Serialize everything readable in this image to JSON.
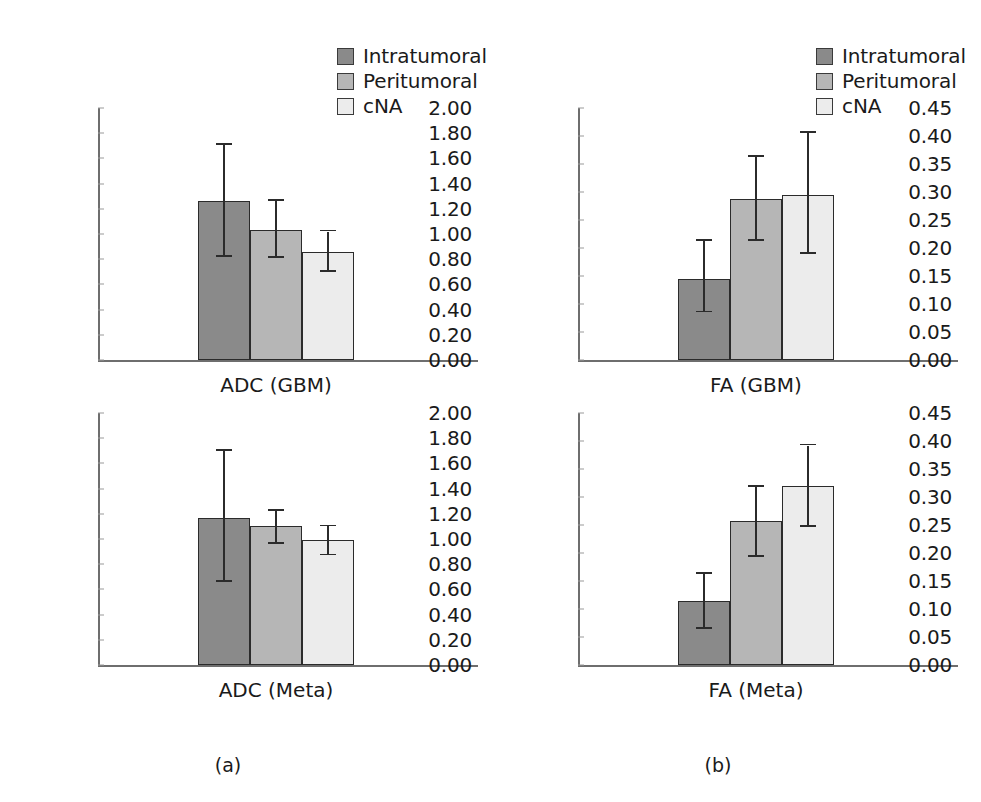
{
  "figure": {
    "captions": [
      {
        "text": "(a)",
        "x": 228,
        "y": 755
      },
      {
        "text": "(b)",
        "x": 718,
        "y": 755
      }
    ]
  },
  "legend": {
    "items": [
      {
        "label": "Intratumoral",
        "color": "#8a8a8a",
        "swatch_name": "legend-swatch-intratumoral"
      },
      {
        "label": "Peritumoral",
        "color": "#b6b6b6",
        "swatch_name": "legend-swatch-peritumoral"
      },
      {
        "label": "cNA",
        "color": "#ececec",
        "swatch_name": "legend-swatch-cna"
      }
    ]
  },
  "colors": {
    "intratumoral": "#8a8a8a",
    "peritumoral": "#b6b6b6",
    "cna": "#ececec",
    "bar_outline": "#2b2b2b",
    "axis": "#6e6e6e",
    "text": "#1a1a1a"
  },
  "chart_data": [
    {
      "id": "adc-gbm",
      "type": "bar",
      "title": "",
      "xlabel": "ADC (GBM)",
      "ylabel": "",
      "ylim": [
        0,
        2.0
      ],
      "ytick_step": 0.2,
      "grid": false,
      "legend_position": "top-right",
      "categories": [
        "Intratumoral",
        "Peritumoral",
        "cNA"
      ],
      "values": [
        1.26,
        1.03,
        0.86
      ],
      "errors_low": [
        0.82,
        0.81,
        0.7
      ],
      "errors_high": [
        1.71,
        1.26,
        1.02
      ],
      "ticks": [
        "2.00",
        "1.80",
        "1.60",
        "1.40",
        "1.20",
        "1.00",
        "0.80",
        "0.60",
        "0.40",
        "0.20",
        "0.00"
      ]
    },
    {
      "id": "fa-gbm",
      "type": "bar",
      "title": "",
      "xlabel": "FA (GBM)",
      "ylabel": "",
      "ylim": [
        0,
        0.45
      ],
      "ytick_step": 0.05,
      "grid": false,
      "legend_position": "top-right",
      "categories": [
        "Intratumoral",
        "Peritumoral",
        "cNA"
      ],
      "values": [
        0.145,
        0.288,
        0.295
      ],
      "errors_low": [
        0.085,
        0.213,
        0.19
      ],
      "errors_high": [
        0.212,
        0.363,
        0.405
      ],
      "ticks": [
        "0.45",
        "0.40",
        "0.35",
        "0.30",
        "0.25",
        "0.20",
        "0.15",
        "0.10",
        "0.05",
        "0.00"
      ]
    },
    {
      "id": "adc-meta",
      "type": "bar",
      "title": "",
      "xlabel": "ADC (Meta)",
      "ylabel": "",
      "ylim": [
        0,
        2.0
      ],
      "ytick_step": 0.2,
      "grid": false,
      "legend_position": "none",
      "categories": [
        "Intratumoral",
        "Peritumoral",
        "cNA"
      ],
      "values": [
        1.17,
        1.1,
        0.99
      ],
      "errors_low": [
        0.66,
        0.96,
        0.87
      ],
      "errors_high": [
        1.7,
        1.22,
        1.1
      ],
      "ticks": [
        "2.00",
        "1.80",
        "1.60",
        "1.40",
        "1.20",
        "1.00",
        "0.80",
        "0.60",
        "0.40",
        "0.20",
        "0.00"
      ]
    },
    {
      "id": "fa-meta",
      "type": "bar",
      "title": "",
      "xlabel": "FA (Meta)",
      "ylabel": "",
      "ylim": [
        0,
        0.45
      ],
      "ytick_step": 0.05,
      "grid": false,
      "legend_position": "none",
      "categories": [
        "Intratumoral",
        "Peritumoral",
        "cNA"
      ],
      "values": [
        0.114,
        0.258,
        0.32
      ],
      "errors_low": [
        0.065,
        0.193,
        0.247
      ],
      "errors_high": [
        0.163,
        0.318,
        0.392
      ],
      "ticks": [
        "0.45",
        "0.40",
        "0.35",
        "0.30",
        "0.25",
        "0.20",
        "0.15",
        "0.10",
        "0.05",
        "0.00"
      ]
    }
  ]
}
